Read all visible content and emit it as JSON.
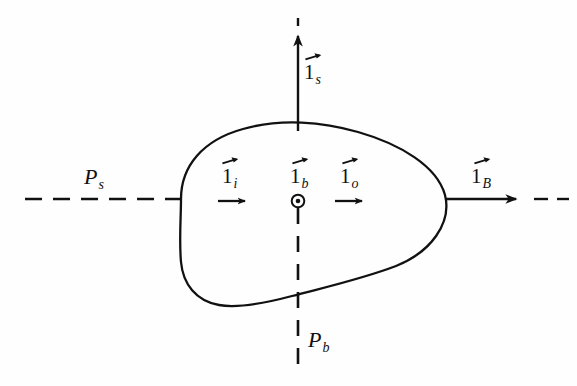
{
  "figure": {
    "type": "vector-diagram",
    "background_color": "#fefefe",
    "stroke_color": "#111111"
  },
  "labels": {
    "source_plane": {
      "base": "P",
      "sub": "s"
    },
    "body_plane": {
      "base": "P",
      "sub": "b"
    },
    "vector_s": {
      "base": "1",
      "sub": "s"
    },
    "vector_i": {
      "base": "1",
      "sub": "i"
    },
    "vector_b": {
      "base": "1",
      "sub": "b"
    },
    "vector_o": {
      "base": "1",
      "sub": "o"
    },
    "vector_B": {
      "base": "1",
      "sub": "B"
    }
  },
  "symbols": {
    "out_of_page": "circle-dot",
    "vector_accent": "right-arrow-overbar"
  },
  "axes": {
    "horizontal": {
      "y": 199,
      "x_start": 25,
      "x_end": 560,
      "style": "dashed-with-solid-arrow-right"
    },
    "vertical": {
      "x": 298,
      "y_start": 18,
      "y_end": 375,
      "style": "dashed-with-solid-arrow-up"
    }
  }
}
